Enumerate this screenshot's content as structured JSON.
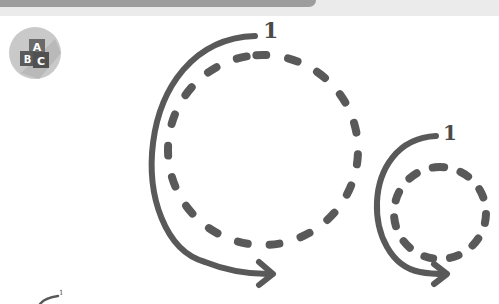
{
  "page": {
    "type": "tracing-worksheet",
    "header_bar_color": "#9d9d9d",
    "background_strip_color": "#ebebeb"
  },
  "badge": {
    "icon": "abc-blocks-icon",
    "letters": [
      "A",
      "B",
      "C"
    ],
    "circle_color": "#c9c9c9",
    "block_color": "#5a5a5a"
  },
  "exercises": [
    {
      "name": "large-circle",
      "step_label": "1",
      "stroke_color": "#595959"
    },
    {
      "name": "small-circle",
      "step_label": "1",
      "stroke_color": "#595959"
    }
  ],
  "example": {
    "step_label": "1"
  }
}
